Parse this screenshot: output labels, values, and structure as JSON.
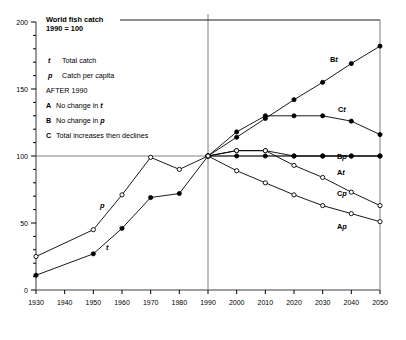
{
  "title": {
    "line1": "World fish catch",
    "line2": "1990 = 100"
  },
  "legend": {
    "entries": [
      {
        "key": "t",
        "label": "Total catch",
        "key_style": "italic"
      },
      {
        "key": "p",
        "label": "Catch per capita",
        "key_style": "italic"
      }
    ],
    "section_heading": "AFTER 1990",
    "scenarios": [
      {
        "key": "A",
        "label_pre": "No change in ",
        "label_var": "t"
      },
      {
        "key": "B",
        "label_pre": "No change in ",
        "label_var": "p"
      },
      {
        "key": "C",
        "label_pre": "Total increases then declines",
        "label_var": ""
      }
    ]
  },
  "axes": {
    "y_ticks": [
      "0",
      "50",
      "100",
      "150",
      "200"
    ],
    "x_ticks": [
      "1930",
      "1940",
      "1950",
      "1960",
      "1970",
      "1980",
      "1990",
      "2000",
      "2010",
      "2020",
      "2030",
      "2040",
      "2050"
    ],
    "reference_year": "1990",
    "reference_value": "100"
  },
  "curve_labels": {
    "t": "t",
    "p": "p",
    "Bt_pre": "B",
    "Bt_var": "t",
    "Ct_pre": "C",
    "Ct_var": "t",
    "Bp_pre": "B",
    "Bp_var": "p",
    "At_pre": "A",
    "At_var": "t",
    "Cp_pre": "C",
    "Cp_var": "p",
    "Ap_pre": "A",
    "Ap_var": "p"
  },
  "colors": {
    "ink": "#000000",
    "grid": "#808080",
    "marker_fill": "#000000",
    "marker_open": "#ffffff"
  },
  "chart_data": {
    "type": "line",
    "subtitle": "1990 = 100",
    "xlabel": "",
    "ylabel": "",
    "xlim": [
      1930,
      2050
    ],
    "ylim": [
      0,
      200
    ],
    "grid": false,
    "legend_position": "inline-labels",
    "x": [
      1930,
      1940,
      1950,
      1960,
      1970,
      1980,
      1990,
      2000,
      2010,
      2020,
      2030,
      2040,
      2050
    ],
    "reference_lines": {
      "vertical_x": 1990,
      "horizontal_y": 100
    },
    "series": [
      {
        "name": "t",
        "description": "Total catch (historical)",
        "marker": "filled",
        "x": [
          1930,
          1950,
          1960,
          1970,
          1980,
          1990
        ],
        "values": [
          11,
          27,
          46,
          69,
          72,
          100
        ]
      },
      {
        "name": "p",
        "description": "Catch per capita (historical)",
        "marker": "open",
        "x": [
          1930,
          1950,
          1960,
          1970,
          1980,
          1990
        ],
        "values": [
          25,
          45,
          71,
          99,
          90,
          100
        ]
      },
      {
        "name": "Bt",
        "description": "Scenario B total catch - no change in p",
        "marker": "filled",
        "x": [
          1990,
          2000,
          2010,
          2020,
          2030,
          2040,
          2050
        ],
        "values": [
          100,
          114,
          128,
          142,
          155,
          169,
          182
        ]
      },
      {
        "name": "Ct",
        "description": "Scenario C total catch - increases then declines",
        "marker": "filled",
        "x": [
          1990,
          2000,
          2010,
          2020,
          2030,
          2040,
          2050
        ],
        "values": [
          100,
          118,
          130,
          130,
          130,
          126,
          116
        ]
      },
      {
        "name": "Bp",
        "description": "Scenario B catch per capita - no change",
        "marker": "open",
        "x": [
          1990,
          2000,
          2010,
          2020,
          2030,
          2040,
          2050
        ],
        "values": [
          100,
          104,
          104,
          100,
          100,
          100,
          100
        ]
      },
      {
        "name": "At",
        "description": "Scenario A total catch - no change in t",
        "marker": "filled",
        "x": [
          1990,
          2000,
          2010,
          2020,
          2030,
          2040,
          2050
        ],
        "values": [
          100,
          100,
          100,
          100,
          100,
          100,
          100
        ]
      },
      {
        "name": "Cp",
        "description": "Scenario C catch per capita",
        "marker": "open",
        "x": [
          1990,
          2000,
          2010,
          2020,
          2030,
          2040,
          2050
        ],
        "values": [
          100,
          104,
          104,
          93,
          84,
          73,
          63
        ]
      },
      {
        "name": "Ap",
        "description": "Scenario A catch per capita",
        "marker": "open",
        "x": [
          1990,
          2000,
          2010,
          2020,
          2030,
          2040,
          2050
        ],
        "values": [
          100,
          89,
          80,
          71,
          63,
          57,
          51
        ]
      }
    ]
  }
}
